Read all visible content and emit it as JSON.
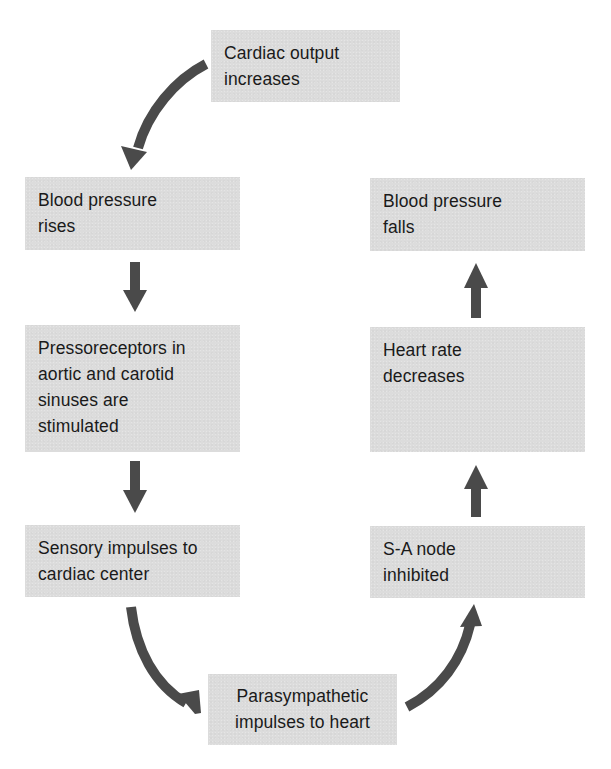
{
  "diagram": {
    "type": "flowchart-cycle",
    "colors": {
      "box_fill": "#dcdcdc",
      "arrow": "#4a4a4a",
      "text": "#1a1a1a",
      "background": "#ffffff"
    },
    "nodes": [
      {
        "id": "cardiac-output",
        "lines": [
          "Cardiac output",
          "increases"
        ]
      },
      {
        "id": "bp-rises",
        "lines": [
          "Blood pressure",
          "rises"
        ]
      },
      {
        "id": "pressoreceptors",
        "lines": [
          "Pressoreceptors in",
          "aortic and carotid",
          "sinuses are",
          "stimulated"
        ]
      },
      {
        "id": "sensory-impulses",
        "lines": [
          "Sensory impulses to",
          "cardiac center"
        ]
      },
      {
        "id": "parasympathetic",
        "lines": [
          "Parasympathetic",
          "impulses to heart"
        ]
      },
      {
        "id": "sa-node",
        "lines": [
          "S-A node",
          "inhibited"
        ]
      },
      {
        "id": "heart-rate",
        "lines": [
          "Heart rate",
          "decreases"
        ]
      },
      {
        "id": "bp-falls",
        "lines": [
          "Blood pressure",
          "falls"
        ]
      }
    ],
    "edges": [
      {
        "from": "cardiac-output",
        "to": "bp-rises",
        "style": "curved"
      },
      {
        "from": "bp-rises",
        "to": "pressoreceptors",
        "style": "straight-down"
      },
      {
        "from": "pressoreceptors",
        "to": "sensory-impulses",
        "style": "straight-down"
      },
      {
        "from": "sensory-impulses",
        "to": "parasympathetic",
        "style": "curved"
      },
      {
        "from": "parasympathetic",
        "to": "sa-node",
        "style": "curved"
      },
      {
        "from": "sa-node",
        "to": "heart-rate",
        "style": "straight-up"
      },
      {
        "from": "heart-rate",
        "to": "bp-falls",
        "style": "straight-up"
      }
    ]
  }
}
